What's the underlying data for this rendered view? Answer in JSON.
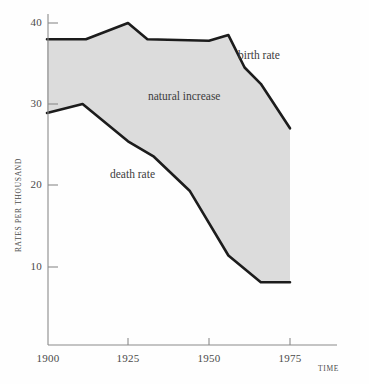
{
  "chart_data": {
    "type": "area",
    "title": "",
    "xlabel": "TIME",
    "ylabel": "RATES PER THOUSAND",
    "xlim": [
      1900,
      1978
    ],
    "ylim": [
      0,
      43
    ],
    "xticks": [
      1900,
      1925,
      1950,
      1975
    ],
    "xticklabels": [
      "1900",
      "1925",
      "1950",
      "1975"
    ],
    "yticks": [
      10,
      20,
      30,
      40
    ],
    "yticklabels": [
      "10",
      "20",
      "30",
      "40"
    ],
    "grid": false,
    "legend_position": "inline-annotations",
    "fill_color": "#dcdcdc",
    "line_color": "#1c1c1c",
    "axis_color": "#8a8a8a",
    "annotations": [
      {
        "text": "birth rate",
        "x": 1952,
        "y": 36.5
      },
      {
        "text": "natural increase",
        "x": 1931,
        "y": 30.5
      },
      {
        "text": "death rate",
        "x": 1920,
        "y": 21.0
      }
    ],
    "series": [
      {
        "name": "birth rate",
        "x": [
          1900,
          1912,
          1925,
          1931,
          1950,
          1956,
          1961,
          1966,
          1975
        ],
        "values": [
          38.0,
          38.0,
          40.0,
          38.0,
          37.8,
          38.5,
          34.5,
          32.5,
          27.0
        ]
      },
      {
        "name": "death rate",
        "x": [
          1900,
          1911,
          1925,
          1933,
          1944,
          1956,
          1966,
          1975
        ],
        "values": [
          28.9,
          30.0,
          25.4,
          23.5,
          19.3,
          11.3,
          8.0,
          8.0
        ]
      }
    ],
    "natural_increase": {
      "name": "natural increase",
      "description": "Shaded band between birth rate and death rate curves"
    }
  }
}
